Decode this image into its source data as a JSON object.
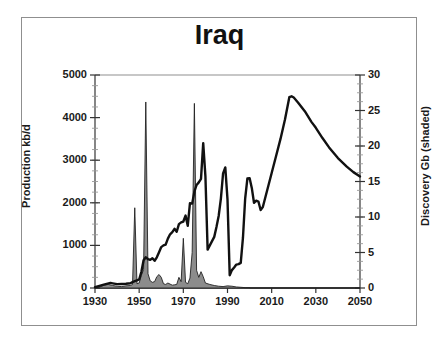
{
  "figure": {
    "title": "Iraq",
    "background_color": "#ffffff",
    "frame_color": "#8f8f8f",
    "line_color": "#111111",
    "shaded_fill_color": "#8c8c8c"
  },
  "chart_data": {
    "type": "line",
    "title": "Iraq",
    "xlabel": "",
    "ylabel": "Production kb/d",
    "y2label": "Discovery Gb (shaded)",
    "xlim": [
      1930,
      2050
    ],
    "ylim": [
      0,
      5000
    ],
    "y2lim": [
      0,
      30
    ],
    "grid": false,
    "legend_position": "none",
    "xticks": [
      1930,
      1950,
      1970,
      1990,
      2010,
      2030,
      2050
    ],
    "xtick_labels": [
      "1930",
      "1950",
      "1970",
      "1990",
      "2010",
      "2030",
      "2050"
    ],
    "yticks": [
      0,
      1000,
      2000,
      3000,
      4000,
      5000
    ],
    "ytick_labels": [
      "0",
      "1000",
      "2000",
      "3000",
      "4000",
      "5000"
    ],
    "y2ticks": [
      0,
      5,
      10,
      15,
      20,
      25,
      30
    ],
    "y2tick_labels": [
      "0",
      "5",
      "10",
      "15",
      "20",
      "25",
      "30"
    ],
    "y_minor_tick_step": 250,
    "y2_minor_tick_step": 1.25,
    "series": [
      {
        "name": "Production kb/d",
        "axis": "left",
        "style": "line",
        "color": "#111111",
        "line_width": 2.4,
        "x": [
          1930,
          1934,
          1937,
          1938,
          1940,
          1942,
          1944,
          1946,
          1947,
          1948,
          1949,
          1950,
          1951,
          1952,
          1953,
          1954,
          1955,
          1956,
          1957,
          1958,
          1959,
          1960,
          1961,
          1962,
          1963,
          1964,
          1965,
          1966,
          1967,
          1968,
          1969,
          1970,
          1971,
          1972,
          1973,
          1974,
          1975,
          1976,
          1977,
          1978,
          1979,
          1980,
          1981,
          1982,
          1983,
          1984,
          1985,
          1986,
          1987,
          1988,
          1989,
          1990,
          1991,
          1992,
          1993,
          1994,
          1995,
          1996,
          1997,
          1998,
          1999,
          2000,
          2001,
          2002,
          2003,
          2004,
          2005,
          2006,
          2008,
          2010,
          2012,
          2014,
          2016,
          2018,
          2019,
          2020,
          2022,
          2025,
          2028,
          2030,
          2033,
          2036,
          2040,
          2044,
          2047,
          2050
        ],
        "y": [
          20,
          80,
          120,
          110,
          90,
          95,
          100,
          110,
          140,
          160,
          180,
          200,
          380,
          650,
          720,
          680,
          660,
          700,
          640,
          720,
          840,
          960,
          1000,
          1020,
          1160,
          1260,
          1310,
          1390,
          1320,
          1500,
          1540,
          1560,
          1700,
          1460,
          1990,
          1980,
          2260,
          2420,
          2480,
          2560,
          3400,
          2620,
          900,
          1000,
          1100,
          1200,
          1430,
          1690,
          2100,
          2690,
          2830,
          2080,
          300,
          420,
          480,
          550,
          560,
          590,
          1180,
          2100,
          2570,
          2580,
          2350,
          2000,
          2050,
          2030,
          1830,
          1900,
          2300,
          2700,
          3100,
          3500,
          3950,
          4480,
          4500,
          4470,
          4350,
          4150,
          3900,
          3760,
          3520,
          3300,
          3050,
          2850,
          2720,
          2620
        ]
      },
      {
        "name": "Discovery Gb",
        "axis": "right",
        "style": "filled-spikes",
        "color": "#8c8c8c",
        "edge_color": "#222222",
        "x": [
          1930,
          1932,
          1934,
          1936,
          1938,
          1940,
          1942,
          1944,
          1946,
          1947,
          1948,
          1949,
          1950,
          1951,
          1952,
          1953,
          1954,
          1955,
          1956,
          1957,
          1958,
          1959,
          1960,
          1961,
          1962,
          1963,
          1964,
          1965,
          1966,
          1967,
          1968,
          1969,
          1970,
          1971,
          1972,
          1973,
          1974,
          1975,
          1976,
          1977,
          1978,
          1979,
          1980,
          1982,
          1984,
          1986,
          1988,
          1990,
          1992,
          1994,
          1996,
          1998,
          2000
        ],
        "y": [
          0.05,
          0.1,
          0.4,
          0.5,
          0.35,
          0.25,
          0.2,
          0.3,
          0.35,
          0.5,
          11.3,
          0.6,
          0.7,
          1.8,
          2.6,
          26.2,
          2.0,
          1.0,
          0.8,
          0.9,
          1.6,
          1.9,
          1.5,
          0.6,
          0.5,
          0.7,
          0.55,
          0.4,
          0.45,
          0.5,
          1.5,
          0.9,
          7.0,
          0.8,
          0.6,
          1.4,
          5.0,
          26.0,
          2.5,
          1.5,
          2.3,
          1.6,
          0.7,
          0.5,
          0.35,
          0.25,
          0.2,
          0.3,
          0.25,
          0.15,
          0.1,
          0.05,
          0.05
        ]
      }
    ],
    "annotations": []
  },
  "axes": {
    "left_title": "Production kb/d",
    "right_title": "Discovery Gb (shaded)"
  }
}
